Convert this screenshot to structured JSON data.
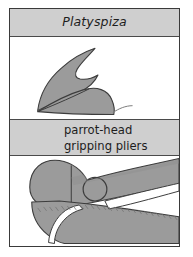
{
  "figure": {
    "name": "beak-and-pliers-comparison-figure",
    "background_color": "#ffffff",
    "frame_color": "#3a3a3a"
  },
  "bands": {
    "taxon": {
      "text": "Platyspiza",
      "style": "italic",
      "background_color": "#cfcfcf",
      "text_color": "#1d1d1d"
    },
    "tool": {
      "line1": "parrot-head",
      "line2": "gripping pliers",
      "background_color": "#cfcfcf",
      "text_color": "#1d1d1d"
    }
  },
  "illustrations": {
    "beak": {
      "label": "bird-beak-illustration",
      "fill_color": "#9b9b9b",
      "stroke_color": "#3c3c3c",
      "parts": [
        "upper-mandible",
        "lower-mandible",
        "gape-line"
      ]
    },
    "pliers": {
      "label": "parrot-head-gripping-pliers-illustration",
      "fill_color": "#9b9b9b",
      "stroke_color": "#3c3c3c",
      "shade_color": "#8d8d8d",
      "parts": [
        "upper-jaw",
        "lower-jaw",
        "pivot-hole",
        "upper-handle",
        "lower-handle",
        "jaw-gap"
      ]
    }
  }
}
